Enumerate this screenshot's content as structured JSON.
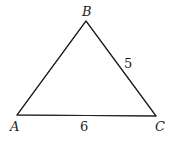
{
  "figure": {
    "type": "triangle",
    "vertices": [
      {
        "id": "A",
        "label": "A"
      },
      {
        "id": "B",
        "label": "B"
      },
      {
        "id": "C",
        "label": "C"
      }
    ],
    "sides": [
      {
        "from": "A",
        "to": "C",
        "label": "6",
        "length": 6
      },
      {
        "from": "B",
        "to": "C",
        "label": "5",
        "length": 5
      },
      {
        "from": "A",
        "to": "B",
        "label": "",
        "length": null
      }
    ],
    "colors": {
      "stroke": "#222222",
      "background": "#ffffff"
    }
  }
}
